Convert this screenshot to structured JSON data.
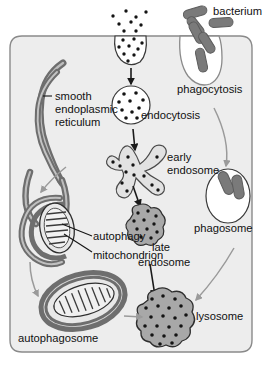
{
  "figure": {
    "type": "cell-biology-diagram"
  },
  "colors": {
    "cell_fill": "#ededed",
    "cell_border": "#8a8a8a",
    "organelle_gray": "#a8a8a8",
    "organelle_light": "#e2e2e2",
    "membrane_dark": "#6e6e6e",
    "bacterium": "#7a7a7a",
    "arrow_black": "#1a1a1a",
    "arrow_gray": "#9a9a9a",
    "dot": "#141414",
    "text": "#111111",
    "white": "#ffffff"
  },
  "labels": {
    "bacterium": "bacterium",
    "phagocytosis": "phagocytosis",
    "endocytosis": "endocytosis",
    "smooth": "smooth",
    "endoplasmic": "endoplasmic",
    "reticulum": "reticulum",
    "early": "early",
    "endosome": "endosome",
    "phagosome": "phagosome",
    "autophagy": "autophagy",
    "mitochondrion": "mitochondrion",
    "late": "late",
    "late_endosome": "endosome",
    "autophagosome": "autophagosome",
    "lysosome": "lysosome"
  },
  "structures": {
    "cell": "plasma-membrane-boundary",
    "pit_vesicle": "coated-pit-forming-vesicle",
    "free_vesicle": "endocytic-vesicle",
    "early_endosome": "early-endosome-tubular",
    "late_endosome": "late-endosome-blob",
    "lysosome": "lysosome-blob",
    "phagocytic_cup": "phagocytic-cup",
    "phagosome": "phagosome-oval",
    "smooth_er": "smooth-endoplasmic-reticulum-tubules",
    "mitochondrion": "mitochondrion-with-cristae",
    "autophagosome": "autophagosome-enclosing-mitochondrion"
  },
  "flows": [
    {
      "from": "pit_vesicle",
      "to": "free_vesicle",
      "style": "black-arrow"
    },
    {
      "from": "free_vesicle",
      "to": "early_endosome",
      "style": "black-arrow"
    },
    {
      "from": "early_endosome",
      "to": "late_endosome",
      "style": "black-arrow"
    },
    {
      "from": "late_endosome",
      "to": "lysosome",
      "style": "black-arrow"
    },
    {
      "from": "phagocytic_cup",
      "to": "phagosome",
      "style": "gray-curved-arrow"
    },
    {
      "from": "phagosome",
      "to": "lysosome",
      "style": "gray-curved-arrow"
    },
    {
      "from": "smooth_er",
      "to": "autophagy",
      "style": "gray-curved-arrow"
    },
    {
      "from": "mitochondrion",
      "to": "autophagosome",
      "style": "gray-curved-arrow"
    },
    {
      "from": "autophagosome",
      "to": "lysosome",
      "style": "gray-arrow"
    }
  ]
}
